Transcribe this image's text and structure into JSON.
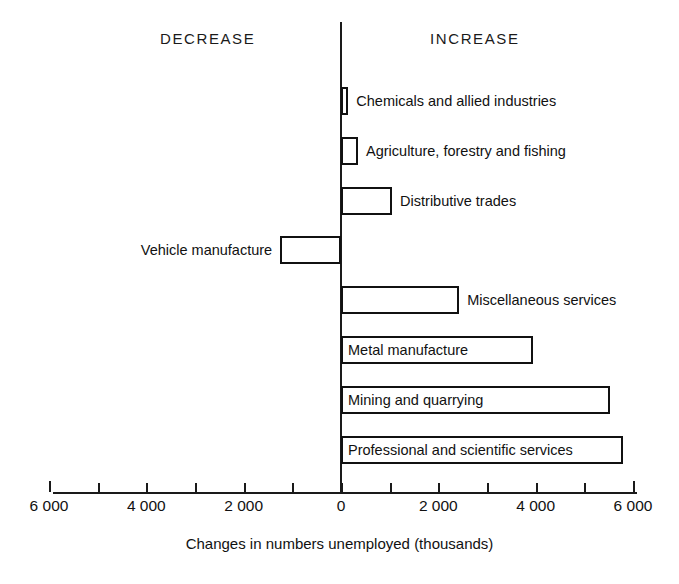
{
  "chart_data": {
    "type": "bar",
    "orientation": "horizontal",
    "title": "",
    "xlabel": "Changes in numbers unemployed (thousands)",
    "ylabel": "",
    "xlim": [
      -6000,
      6000
    ],
    "grid": false,
    "legend": null,
    "tick_step": 1000,
    "categories": [
      "Chemicals and allied industries",
      "Agriculture, forestry and fishing",
      "Distributive trades",
      "Vehicle manufacture",
      "Miscellaneous services",
      "Metal manufacture",
      "Mining and quarrying",
      "Professional and scientific services"
    ],
    "values": [
      150,
      350,
      1050,
      -1250,
      2430,
      3950,
      5530,
      5800
    ],
    "annotations": {
      "left_header": "DECREASE",
      "right_header": "INCREASE"
    },
    "tick_labels": [
      {
        "value": -6000,
        "label": "6 000"
      },
      {
        "value": -4000,
        "label": "4 000"
      },
      {
        "value": -2000,
        "label": "2 000"
      },
      {
        "value": 0,
        "label": "0"
      },
      {
        "value": 2000,
        "label": "2 000"
      },
      {
        "value": 4000,
        "label": "4 000"
      },
      {
        "value": 6000,
        "label": "6 000"
      }
    ],
    "colors": {
      "bar_fill": "#ffffff",
      "bar_stroke": "#111111",
      "axis": "#1a1a1a",
      "text": "#111111",
      "background": "#ffffff"
    }
  },
  "headers": {
    "decrease": "DECREASE",
    "increase": "INCREASE"
  },
  "axis": {
    "title": "Changes in numbers unemployed (thousands)",
    "labels": [
      "6 000",
      "4 000",
      "2 000",
      "0",
      "2 000",
      "4 000",
      "6 000"
    ]
  },
  "bars": [
    {
      "label": "Chemicals and allied industries",
      "value": 150,
      "label_side": "right"
    },
    {
      "label": "Agriculture, forestry and fishing",
      "value": 350,
      "label_side": "right"
    },
    {
      "label": "Distributive trades",
      "value": 1050,
      "label_side": "right"
    },
    {
      "label": "Vehicle manufacture",
      "value": -1250,
      "label_side": "left"
    },
    {
      "label": "Miscellaneous services",
      "value": 2430,
      "label_side": "right"
    },
    {
      "label": "Metal manufacture",
      "value": 3950,
      "label_side": "inside"
    },
    {
      "label": "Mining and quarrying",
      "value": 5530,
      "label_side": "inside"
    },
    {
      "label": "Professional and scientific services",
      "value": 5800,
      "label_side": "inside"
    }
  ]
}
